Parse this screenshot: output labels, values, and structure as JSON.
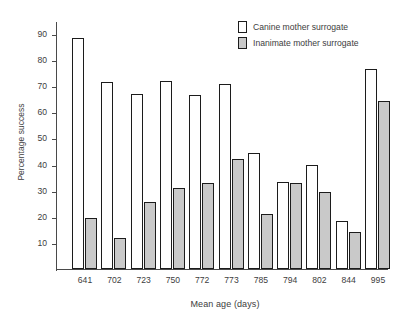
{
  "chart_data": {
    "type": "bar",
    "title": "",
    "xlabel": "Mean age (days)",
    "ylabel": "Percentage success",
    "categories": [
      "641",
      "702",
      "723",
      "750",
      "772",
      "773",
      "785",
      "794",
      "802",
      "844",
      "995"
    ],
    "series": [
      {
        "name": "Canine mother surrogate",
        "color": "#ffffff",
        "values": [
          88.5,
          71.5,
          67.0,
          72.0,
          66.5,
          71.0,
          44.5,
          33.5,
          40.0,
          18.5,
          76.5
        ]
      },
      {
        "name": "Inanimate mother surrogate",
        "color": "#c9c9c9",
        "values": [
          19.5,
          12.0,
          25.5,
          31.0,
          33.0,
          42.0,
          21.0,
          33.0,
          29.5,
          14.0,
          64.5
        ]
      }
    ],
    "ylim": [
      0,
      95
    ],
    "yticks": [
      10,
      20,
      30,
      40,
      50,
      60,
      70,
      80,
      90
    ],
    "ytick_labels": [
      "10",
      "20",
      "30",
      "40",
      "50",
      "60",
      "70",
      "80",
      "90"
    ],
    "grid": false,
    "legend_position": "top-right",
    "bar_border_color": "#1c1c1c"
  },
  "axes": {
    "y_title": "Percentage success",
    "x_title": "Mean age (days)"
  },
  "legend": {
    "entries": [
      {
        "label": "Canine mother surrogate",
        "swatch": "white-bar-swatch"
      },
      {
        "label": "Inanimate mother surrogate",
        "swatch": "gray-bar-swatch"
      }
    ]
  }
}
